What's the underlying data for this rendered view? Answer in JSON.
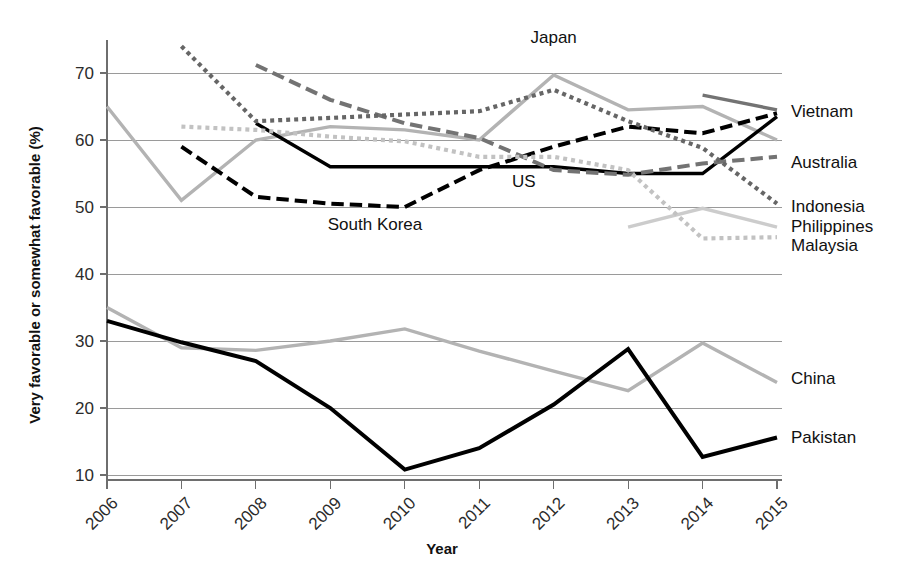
{
  "chart_data": {
    "type": "line",
    "title": "",
    "xlabel": "Year",
    "ylabel": "Very favorable or somewhat favorable (%)",
    "x": [
      2006,
      2007,
      2008,
      2009,
      2010,
      2011,
      2012,
      2013,
      2014,
      2015
    ],
    "xtick_labels": [
      "2006",
      "2007",
      "2008",
      "2009",
      "2010",
      "2011",
      "2012",
      "2013",
      "2014",
      "2015"
    ],
    "ytick_labels": [
      "10",
      "20",
      "30",
      "40",
      "50",
      "60",
      "70"
    ],
    "ytick_values": [
      10,
      20,
      30,
      40,
      50,
      60,
      70
    ],
    "xlim": [
      2006,
      2015
    ],
    "ylim": [
      7,
      76
    ],
    "grid": true,
    "legend_position": "right-edge-inline",
    "series": [
      {
        "name": "Japan",
        "label": "Japan",
        "label_position": "inline-above",
        "color": "#b3b3b3",
        "style": "solid",
        "width": 3.4,
        "x": [
          2006,
          2007,
          2008,
          2009,
          2010,
          2011,
          2012,
          2013,
          2014,
          2015
        ],
        "values": [
          65,
          51,
          60,
          62,
          61.5,
          60,
          69.7,
          64.5,
          65,
          60
        ]
      },
      {
        "name": "US",
        "label": "US",
        "label_position": "inline-below",
        "color": "#000000",
        "style": "solid",
        "width": 3.4,
        "x": [
          2008,
          2009,
          2010,
          2011,
          2012,
          2013,
          2014,
          2015
        ],
        "values": [
          62.5,
          56,
          56,
          56,
          56,
          55,
          55,
          63.5
        ]
      },
      {
        "name": "South Korea",
        "label": "South Korea",
        "label_position": "inline-below",
        "color": "#000000",
        "style": "dashed",
        "width": 4.0,
        "x": [
          2007,
          2008,
          2009,
          2010,
          2011,
          2012,
          2013,
          2014,
          2015
        ],
        "values": [
          59,
          51.5,
          50.5,
          50,
          55.5,
          59,
          62,
          61,
          64
        ]
      },
      {
        "name": "Vietnam",
        "label": "Vietnam",
        "label_position": "right",
        "color": "#737373",
        "style": "solid",
        "width": 3.4,
        "x": [
          2014,
          2015
        ],
        "values": [
          66.7,
          64.5
        ]
      },
      {
        "name": "Australia",
        "label": "Australia",
        "label_position": "right",
        "color": "#737373",
        "style": "dashed",
        "width": 4.0,
        "x": [
          2008,
          2009,
          2010,
          2011,
          2012,
          2013,
          2014,
          2015
        ],
        "values": [
          71.2,
          66,
          62.5,
          60.3,
          55.5,
          54.8,
          56.5,
          57.5
        ]
      },
      {
        "name": "Indonesia",
        "label": "Indonesia",
        "label_position": "right",
        "color": "#666666",
        "style": "dotted",
        "width": 4.2,
        "x": [
          2007,
          2008,
          2009,
          2010,
          2011,
          2012,
          2013,
          2014,
          2015
        ],
        "values": [
          74,
          62.8,
          63.3,
          63.8,
          64.3,
          67.5,
          62.8,
          58.8,
          50.5
        ]
      },
      {
        "name": "Philippines",
        "label": "Philippines",
        "label_position": "right",
        "color": "#cccccc",
        "style": "solid",
        "width": 3.4,
        "x": [
          2013,
          2014,
          2015
        ],
        "values": [
          47,
          49.8,
          47
        ]
      },
      {
        "name": "Malaysia",
        "label": "Malaysia",
        "label_position": "right",
        "color": "#c2c2c2",
        "style": "dotted",
        "width": 4.2,
        "x": [
          2007,
          2008,
          2009,
          2010,
          2011,
          2012,
          2013,
          2014,
          2015
        ],
        "values": [
          62,
          61.5,
          60.5,
          59.8,
          57.5,
          57.5,
          55.5,
          45.3,
          45.5
        ]
      },
      {
        "name": "China",
        "label": "China",
        "label_position": "right",
        "color": "#b3b3b3",
        "style": "solid",
        "width": 3.4,
        "x": [
          2006,
          2007,
          2008,
          2009,
          2010,
          2011,
          2012,
          2013,
          2014,
          2015
        ],
        "values": [
          35,
          29,
          28.6,
          30,
          31.8,
          28.5,
          25.5,
          22.6,
          29.7,
          23.8
        ]
      },
      {
        "name": "Pakistan",
        "label": "Pakistan",
        "label_position": "right",
        "color": "#000000",
        "style": "solid",
        "width": 4.0,
        "x": [
          2006,
          2007,
          2008,
          2009,
          2010,
          2011,
          2012,
          2013,
          2014,
          2015
        ],
        "values": [
          33,
          29.8,
          27,
          20,
          10.8,
          14,
          20.5,
          28.8,
          12.7,
          15.6
        ]
      }
    ],
    "inline_annotations": [
      {
        "text": "Japan",
        "x": 2012,
        "y": 74.5,
        "name": "japan"
      },
      {
        "text": "US",
        "x": 2011.6,
        "y": 53.0,
        "name": "us"
      },
      {
        "text": "South Korea",
        "x": 2009.6,
        "y": 46.5,
        "name": "south-korea"
      }
    ],
    "right_labels": [
      {
        "text": "Vietnam",
        "y": 64.3,
        "name": "vietnam"
      },
      {
        "text": "Australia",
        "y": 56.7,
        "name": "australia"
      },
      {
        "text": "Indonesia",
        "y": 50.2,
        "name": "indonesia"
      },
      {
        "text": "Philippines",
        "y": 47.2,
        "name": "philippines"
      },
      {
        "text": "Malaysia",
        "y": 44.3,
        "name": "malaysia"
      },
      {
        "text": "China",
        "y": 24.5,
        "name": "china"
      },
      {
        "text": "Pakistan",
        "y": 15.6,
        "name": "pakistan"
      }
    ]
  }
}
